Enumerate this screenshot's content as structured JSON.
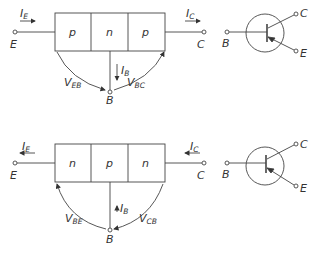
{
  "diagrams": [
    {
      "type": "pnp",
      "layers": [
        "p",
        "n",
        "p"
      ],
      "terminals": {
        "emitter": "E",
        "collector": "C",
        "base": "B"
      },
      "currents": {
        "emitter": {
          "main": "I",
          "sub": "E"
        },
        "collector": {
          "main": "I",
          "sub": "C"
        },
        "base": {
          "main": "I",
          "sub": "B"
        }
      },
      "voltages": {
        "left": {
          "main": "V",
          "sub": "EB"
        },
        "right": {
          "main": "V",
          "sub": "BC"
        }
      },
      "symbol": {
        "base": "B",
        "collector": "C",
        "emitter": "E"
      }
    },
    {
      "type": "npn",
      "layers": [
        "n",
        "p",
        "n"
      ],
      "terminals": {
        "emitter": "E",
        "collector": "C",
        "base": "B"
      },
      "currents": {
        "emitter": {
          "main": "I",
          "sub": "E"
        },
        "collector": {
          "main": "I",
          "sub": "C"
        },
        "base": {
          "main": "I",
          "sub": "B"
        }
      },
      "voltages": {
        "left": {
          "main": "V",
          "sub": "BE"
        },
        "right": {
          "main": "V",
          "sub": "CB"
        }
      },
      "symbol": {
        "base": "B",
        "collector": "C",
        "emitter": "E"
      }
    }
  ],
  "colors": {
    "line": "#444444",
    "text": "#333333",
    "background": "#ffffff"
  }
}
